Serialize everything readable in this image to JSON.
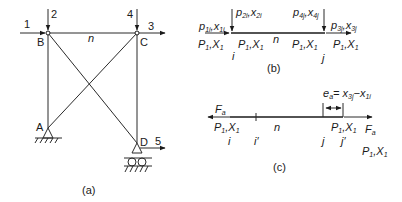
{
  "figure_a": {
    "caption": "(a)",
    "nodes": {
      "A": "A",
      "B": "B",
      "C": "C",
      "D": "D"
    },
    "member_label": "n",
    "dof_labels": {
      "d1": "1",
      "d2": "2",
      "d3": "3",
      "d4": "4",
      "d5": "5"
    }
  },
  "figure_b": {
    "caption": "(b)",
    "member_label": "n",
    "node_i": "i",
    "node_j": "j",
    "forces": {
      "f1": {
        "p": "p",
        "p_sub": "1i",
        "x": "x",
        "x_sub": "1i"
      },
      "f2": {
        "p": "p",
        "p_sub": "2i",
        "x": "x",
        "x_sub": "2i"
      },
      "f4": {
        "p": "p",
        "p_sub": "4j",
        "x": "x",
        "x_sub": "4j"
      },
      "f3": {
        "p": "p",
        "p_sub": "3j",
        "x": "x",
        "x_sub": "3j"
      }
    },
    "param_label": {
      "P": "P",
      "P_sub": "1",
      "X": "X",
      "X_sub": "1",
      "sep": ","
    }
  },
  "figure_c": {
    "caption": "(c)",
    "member_label": "n",
    "node_i": "i",
    "node_i_prime": "i′",
    "node_j": "j",
    "node_j_prime": "j′",
    "force_label": "F",
    "force_sub": "a",
    "elongation": {
      "e": "e",
      "e_sub": "a",
      "eq": "= x",
      "x1_sub": "3j",
      "minus": "−x",
      "x2_sub": "1i"
    },
    "param_label": {
      "P": "P",
      "P_sub": "1",
      "X": "X",
      "X_sub": "1",
      "sep": ","
    }
  }
}
